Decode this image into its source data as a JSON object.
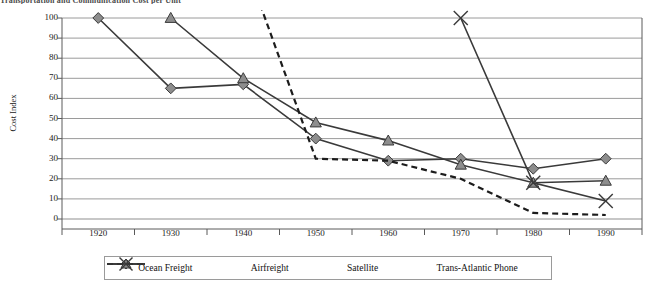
{
  "chart_data": {
    "type": "line",
    "title": "Transportation and Communication Cost per Unit",
    "xlabel": "",
    "ylabel": "Cost Index",
    "categories": [
      "1920",
      "1930",
      "1940",
      "1950",
      "1960",
      "1970",
      "1980",
      "1990"
    ],
    "ylim": [
      0,
      100
    ],
    "ytick_labels": [
      "0",
      "10",
      "20",
      "30",
      "40",
      "50",
      "60",
      "70",
      "80",
      "90",
      "100"
    ],
    "grid": true,
    "legend_position": "bottom",
    "series": [
      {
        "name": "Ocean Freight",
        "marker": "diamond",
        "line": "solid",
        "color": "#3a3a3a",
        "values": [
          100,
          65,
          67,
          40,
          29,
          30,
          25,
          30
        ]
      },
      {
        "name": "Airfreight",
        "marker": "triangle",
        "line": "solid",
        "color": "#3a3a3a",
        "values": [
          null,
          100,
          70,
          48,
          39,
          27,
          18,
          19
        ]
      },
      {
        "name": "Satellite",
        "marker": "none",
        "line": "dashed",
        "color": "#1c1c1c",
        "values": [
          null,
          null,
          130,
          30,
          29,
          20,
          3,
          2
        ]
      },
      {
        "name": "Trans-Atlantic Phone",
        "marker": "x",
        "line": "solid",
        "color": "#3a3a3a",
        "values": [
          null,
          null,
          null,
          null,
          null,
          100,
          18,
          9
        ]
      }
    ]
  },
  "colors": {
    "marker_fill": "#8d8d8d",
    "marker_stroke": "#3a3a3a",
    "grid": "#8f8f8f",
    "axis": "#5a5a5a",
    "text": "#1c1c1c"
  },
  "legend": {
    "items": [
      {
        "label": "Ocean Freight",
        "key": "diamond-solid-key"
      },
      {
        "label": "Airfreight",
        "key": "triangle-solid-key"
      },
      {
        "label": "Satellite",
        "key": "dashed-key"
      },
      {
        "label": "Trans-Atlantic Phone",
        "key": "x-solid-key"
      }
    ]
  }
}
